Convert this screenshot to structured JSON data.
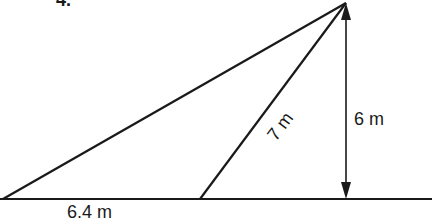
{
  "diagram": {
    "problem_number_partial": "4.",
    "labels": {
      "base": "6.4 m",
      "slant": "7 m",
      "height": "6 m"
    },
    "colors": {
      "line": "#1a1a1a",
      "background": "#ffffff"
    },
    "points": {
      "left_vertex": [
        3,
        199
      ],
      "slant_foot": [
        200,
        199
      ],
      "apex": [
        346,
        3
      ],
      "height_foot": [
        346,
        199
      ]
    }
  }
}
